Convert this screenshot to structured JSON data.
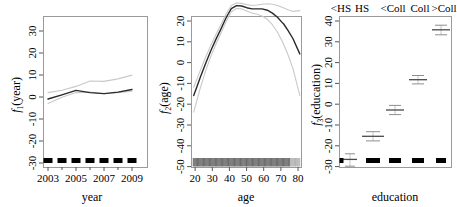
{
  "figure": {
    "type": "multi-panel partial effect plot",
    "panel_count": 3
  },
  "chart_data": [
    {
      "type": "line",
      "panel_id": "year",
      "title": "",
      "xlabel": "year",
      "ylabel": "f₁(year)",
      "ylabel_base": "f",
      "ylabel_sub": "1",
      "ylabel_rest": "(year)",
      "xlim": [
        2002.4,
        2009.6
      ],
      "ylim": [
        -35,
        35
      ],
      "xticks": [
        2003,
        2005,
        2007,
        2009
      ],
      "xtick_labels": [
        "2003",
        "2005",
        "2007",
        "2009"
      ],
      "xticks_minor": [
        2004,
        2006,
        2008
      ],
      "yticks": [
        -30,
        -20,
        -10,
        0,
        10,
        20,
        30
      ],
      "ytick_labels": [
        "-30",
        "-20",
        "-10",
        "0",
        "10",
        "20",
        "30"
      ],
      "grid": false,
      "legend": "none",
      "x": [
        2003,
        2004,
        2005,
        2006,
        2007,
        2008,
        2009
      ],
      "values": [
        -4.5,
        -2.6,
        -0.6,
        2.0,
        1.6,
        2.3,
        3.4
      ],
      "series": [
        {
          "name": "fit",
          "values": [
            -4.5,
            -2.6,
            -0.6,
            2.0,
            1.6,
            2.3,
            3.4
          ]
        },
        {
          "name": "upper CI",
          "values": [
            -2.0,
            -0.9,
            0.8,
            3.6,
            3.4,
            4.5,
            6.2
          ]
        },
        {
          "name": "lower CI",
          "values": [
            -7.2,
            -4.4,
            -2.0,
            0.4,
            -0.3,
            0.2,
            0.8
          ]
        }
      ],
      "rug_values": [
        2003,
        2004,
        2005,
        2006,
        2007,
        2008,
        2009
      ],
      "rug_style": "thick-blocks"
    },
    {
      "type": "line",
      "panel_id": "age",
      "title": "",
      "xlabel": "age",
      "ylabel": "f₂(age)",
      "ylabel_base": "f",
      "ylabel_sub": "2",
      "ylabel_rest": "(age)",
      "xlim": [
        17,
        81
      ],
      "ylim": [
        -53,
        21
      ],
      "xticks": [
        20,
        30,
        40,
        50,
        60,
        70,
        80
      ],
      "xtick_labels": [
        "20",
        "30",
        "40",
        "50",
        "60",
        "70",
        "80"
      ],
      "yticks": [
        -50,
        -40,
        -30,
        -20,
        -10,
        0,
        10,
        20
      ],
      "ytick_labels": [
        "-50",
        "-40",
        "-30",
        "-20",
        "-10",
        "0",
        "10",
        "20"
      ],
      "grid": false,
      "legend": "none",
      "x": [
        18,
        20,
        22,
        25,
        28,
        31,
        34,
        37,
        40,
        43,
        46,
        49,
        52,
        55,
        58,
        61,
        64,
        67,
        70,
        73,
        76,
        80
      ],
      "values": [
        -36.0,
        -31.5,
        -27.0,
        -20.5,
        -14.5,
        -9.0,
        -3.8,
        1.5,
        5.8,
        7.2,
        7.0,
        6.2,
        5.6,
        5.6,
        5.6,
        5.0,
        3.6,
        1.6,
        -1.2,
        -4.6,
        -8.6,
        -16.0
      ],
      "series": [
        {
          "name": "fit",
          "values": [
            -36.0,
            -31.5,
            -27.0,
            -20.5,
            -14.5,
            -9.0,
            -3.8,
            1.5,
            5.8,
            7.2,
            7.0,
            6.2,
            5.6,
            5.6,
            5.6,
            5.0,
            3.6,
            1.6,
            -1.2,
            -4.6,
            -8.6,
            -16.0
          ]
        },
        {
          "name": "upper CI",
          "values": [
            -32.0,
            -27.8,
            -23.6,
            -17.4,
            -11.8,
            -6.6,
            -1.6,
            3.4,
            7.4,
            8.6,
            8.4,
            7.8,
            7.4,
            7.6,
            8.0,
            8.2,
            8.0,
            7.4,
            6.4,
            5.4,
            4.6,
            5.0
          ]
        },
        {
          "name": "lower CI",
          "values": [
            -44.0,
            -38.0,
            -32.0,
            -24.0,
            -17.2,
            -11.4,
            -6.0,
            -0.4,
            4.2,
            5.8,
            5.6,
            4.6,
            3.6,
            3.0,
            2.2,
            0.6,
            -2.0,
            -5.6,
            -10.4,
            -16.2,
            -23.0,
            -36.0
          ]
        }
      ],
      "rug_style": "dense-ticks",
      "rug_range": [
        18,
        80
      ]
    },
    {
      "type": "scatter",
      "panel_id": "education",
      "title": "",
      "xlabel": "education",
      "ylabel": "f₃(education)",
      "ylabel_base": "f",
      "ylabel_sub": "3",
      "ylabel_rest": "(education)",
      "ylim": [
        -33,
        42
      ],
      "yticks": [
        -30,
        -20,
        -10,
        0,
        10,
        20,
        30,
        40
      ],
      "ytick_labels": [
        "-30",
        "-20",
        "-10",
        "0",
        "10",
        "20",
        "30",
        "40"
      ],
      "grid": false,
      "legend": "none",
      "categories": [
        "<HS",
        "HS",
        "<Coll",
        "Coll",
        ">Coll"
      ],
      "top_labels": [
        "<HS",
        "HS",
        "<Coll",
        "Coll",
        ">Coll"
      ],
      "values": [
        -26.3,
        -15.2,
        -2.8,
        11.8,
        35.8
      ],
      "series": [
        {
          "name": "estimate",
          "values": [
            -26.3,
            -15.2,
            -2.8,
            11.8,
            35.8
          ]
        },
        {
          "name": "upper",
          "values": [
            -23.6,
            -13.0,
            -0.6,
            13.8,
            38.0
          ]
        },
        {
          "name": "lower",
          "values": [
            -30.6,
            -17.4,
            -5.0,
            9.8,
            33.4
          ]
        }
      ],
      "rug_style": "thick-blocks",
      "rug_categories": [
        "<HS",
        "HS",
        "<Coll",
        "Coll",
        ">Coll"
      ]
    }
  ]
}
